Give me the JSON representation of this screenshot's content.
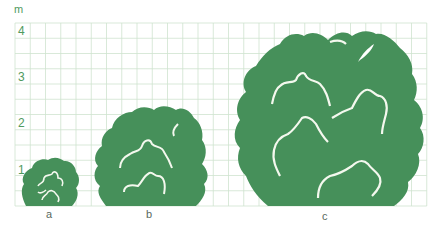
{
  "diagram": {
    "unit_label": "m",
    "y_ticks": [
      "1",
      "2",
      "3",
      "4"
    ],
    "grid_color": "#cfe3cf",
    "shrub_color": "#46905a",
    "vein_color": "#f4f8ee",
    "shrubs": [
      {
        "label": "a",
        "approx_height_m": 1.1
      },
      {
        "label": "b",
        "approx_height_m": 2.2
      },
      {
        "label": "c",
        "approx_height_m": 4.0
      }
    ]
  }
}
